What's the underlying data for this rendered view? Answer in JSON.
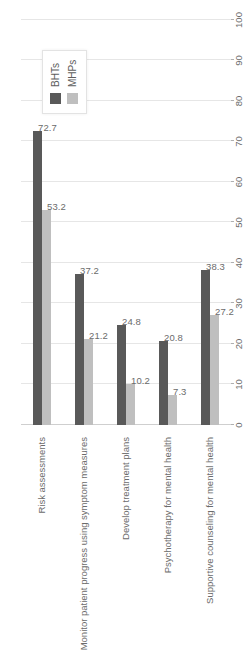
{
  "chart_data": {
    "type": "bar",
    "title": "",
    "subtitle": "",
    "xlabel": "",
    "ylabel": "",
    "orientation": "vertical-rotated",
    "grid": true,
    "legend_position": "top-right",
    "ylim": [
      0,
      100
    ],
    "tick_labels": [
      "0",
      "10",
      "20",
      "30",
      "40",
      "50",
      "60",
      "70",
      "80",
      "90",
      "100"
    ],
    "tick_values": [
      0,
      10,
      20,
      30,
      40,
      50,
      60,
      70,
      80,
      90,
      100
    ],
    "categories": [
      "Risk assessments",
      "Monitor patient progress using symptom measures",
      "Develop treatment plans",
      "Psychotherapy for mental health",
      "Supportive counseling for mental health"
    ],
    "series": [
      {
        "name": "BHTs",
        "color": "#595959",
        "values": [
          72.7,
          37.2,
          24.8,
          20.8,
          38.3
        ],
        "labels": [
          "72.7",
          "37.2",
          "24.8",
          "20.8",
          "38.3"
        ]
      },
      {
        "name": "MHPs",
        "color": "#bfbfbf",
        "values": [
          53.2,
          21.2,
          10.2,
          7.3,
          27.2
        ],
        "labels": [
          "53.2",
          "21.2",
          "10.2",
          "7.3",
          "27.2"
        ]
      }
    ]
  },
  "legend": {
    "items": [
      {
        "label": "BHTs",
        "swatch": "dark-gray-swatch-icon"
      },
      {
        "label": "MHPs",
        "swatch": "light-gray-swatch-icon"
      }
    ]
  }
}
